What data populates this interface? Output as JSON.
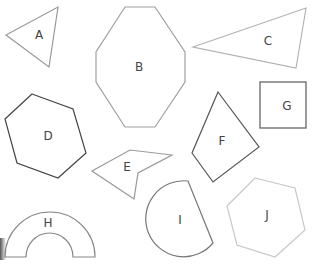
{
  "diagram": {
    "title": "",
    "shapes": [
      {
        "id": "A",
        "label": "A",
        "type": "triangle",
        "stroke": "#999999"
      },
      {
        "id": "B",
        "label": "B",
        "type": "octagon",
        "stroke": "#a0a0a0"
      },
      {
        "id": "C",
        "label": "C",
        "type": "triangle",
        "stroke": "#b0b0b0"
      },
      {
        "id": "D",
        "label": "D",
        "type": "hexagon",
        "stroke": "#444444"
      },
      {
        "id": "E",
        "label": "E",
        "type": "concave-quadrilateral",
        "stroke": "#999999"
      },
      {
        "id": "F",
        "label": "F",
        "type": "quadrilateral",
        "stroke": "#555555"
      },
      {
        "id": "G",
        "label": "G",
        "type": "square",
        "stroke": "#666666"
      },
      {
        "id": "H",
        "label": "H",
        "type": "semi-annulus",
        "stroke": "#888888"
      },
      {
        "id": "I",
        "label": "I",
        "type": "circular-segment",
        "stroke": "#777777"
      },
      {
        "id": "J",
        "label": "J",
        "type": "hexagon",
        "stroke": "#c8c8c8"
      }
    ]
  }
}
